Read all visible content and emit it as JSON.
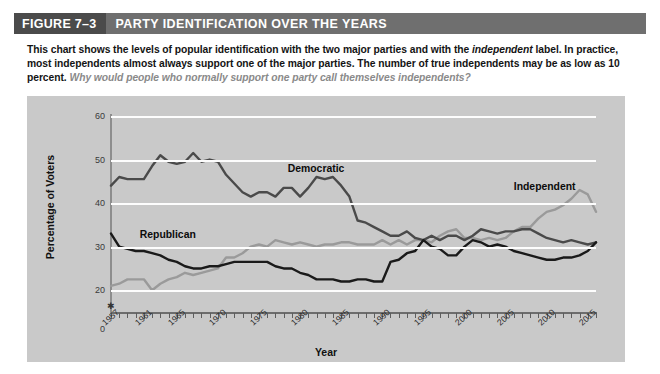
{
  "header": {
    "figure_number": "FIGURE 7–3",
    "title": "PARTY IDENTIFICATION OVER THE YEARS",
    "bar_color": "#6f6f6f",
    "number_block_color": "#4b4b4b"
  },
  "caption": {
    "part1": "This chart shows the levels of popular identification with the two major parties and with the ",
    "emphasis1": "independent",
    "part2": " label. In practice, most independents almost always support one of the major parties. The number of true independents may be as low as 10 percent. ",
    "question": "Why would people who normally support one party call themselves independents?"
  },
  "chart_data": {
    "type": "line",
    "title": "Party Identification Over the Years",
    "xlabel": "Year",
    "ylabel": "Percentage of Voters",
    "xlim": [
      1957,
      2016
    ],
    "ylim": [
      15,
      60
    ],
    "y_ticks": [
      20,
      30,
      40,
      50,
      60
    ],
    "y_zero_label": "0",
    "grid": true,
    "gridline_color": "#fdfdfd",
    "panel_color": "#c9c9c9",
    "legend": "inline-labels",
    "x_tick_labels": [
      "1957",
      "1961",
      "1965",
      "1970",
      "1975",
      "1980",
      "1985",
      "1990",
      "1995",
      "2000",
      "2005",
      "2010",
      "2015"
    ],
    "x_tick_years": [
      1957,
      1961,
      1965,
      1970,
      1975,
      1980,
      1985,
      1990,
      1995,
      2000,
      2005,
      2010,
      2015
    ],
    "x": [
      1957,
      1958,
      1959,
      1960,
      1961,
      1962,
      1963,
      1964,
      1965,
      1966,
      1967,
      1968,
      1969,
      1970,
      1971,
      1972,
      1973,
      1974,
      1975,
      1976,
      1977,
      1978,
      1979,
      1980,
      1981,
      1982,
      1983,
      1984,
      1985,
      1986,
      1987,
      1988,
      1989,
      1990,
      1991,
      1992,
      1993,
      1994,
      1995,
      1996,
      1997,
      1998,
      1999,
      2000,
      2001,
      2002,
      2003,
      2004,
      2005,
      2006,
      2007,
      2008,
      2009,
      2010,
      2011,
      2012,
      2013,
      2014,
      2015,
      2016
    ],
    "series": [
      {
        "name": "Democratic",
        "color": "#4a4a4a",
        "label_x": 1978.5,
        "label_y": 47.5,
        "values": [
          44,
          46,
          45.5,
          45.5,
          45.5,
          48.5,
          51,
          49.5,
          49,
          49.5,
          51.5,
          49.5,
          50,
          49.5,
          46.5,
          44.5,
          42.5,
          41.5,
          42.5,
          42.5,
          41.5,
          43.5,
          43.5,
          41.5,
          43.5,
          46,
          45.5,
          46,
          44,
          41.5,
          36,
          35.5,
          34.5,
          33.5,
          32.5,
          32.5,
          33.5,
          32,
          31.5,
          32.5,
          31.5,
          32.5,
          32.5,
          31.5,
          32.5,
          34,
          33.5,
          33,
          33.5,
          33.5,
          34,
          34,
          33,
          32,
          31.5,
          31,
          31.5,
          31,
          30.5,
          31
        ]
      },
      {
        "name": "Republican",
        "color": "#1a1a1a",
        "label_x": 1960.5,
        "label_y": 32.5,
        "values": [
          33,
          30,
          29.5,
          29,
          29,
          28.5,
          28,
          27,
          26.5,
          25.5,
          25,
          25,
          25.5,
          25.5,
          26,
          26.5,
          26.5,
          26.5,
          26.5,
          26.5,
          25.5,
          25,
          25,
          24,
          23.5,
          22.5,
          22.5,
          22.5,
          22,
          22,
          22.5,
          22.5,
          22,
          22,
          26.5,
          27,
          28.5,
          29,
          31.5,
          30,
          29.5,
          28,
          28,
          30,
          31.5,
          31,
          30,
          30.5,
          30,
          29,
          28.5,
          28,
          27.5,
          27,
          27,
          27.5,
          27.5,
          28,
          29,
          31
        ]
      },
      {
        "name": "Independent",
        "color": "#9a9a9a",
        "label_x": 2006,
        "label_y": 43.5,
        "values": [
          21,
          21.5,
          22.5,
          22.5,
          22.5,
          20,
          21.5,
          22.5,
          23,
          24,
          23.5,
          24,
          24.5,
          25,
          27.5,
          27.5,
          28.5,
          30,
          30.5,
          30,
          31.5,
          31,
          30.5,
          31,
          30.5,
          30,
          30.5,
          30.5,
          31,
          31,
          30.5,
          30.5,
          30.5,
          31.5,
          30.5,
          31.5,
          30.5,
          31.5,
          31.5,
          31,
          32.5,
          33.5,
          34,
          32,
          32,
          31.5,
          32,
          31.5,
          32,
          33.5,
          34.5,
          34.5,
          36.5,
          38,
          38.5,
          39.5,
          41,
          43,
          42,
          38
        ]
      }
    ]
  },
  "axis_titles": {
    "y": "Percentage of Voters",
    "x": "Year"
  }
}
